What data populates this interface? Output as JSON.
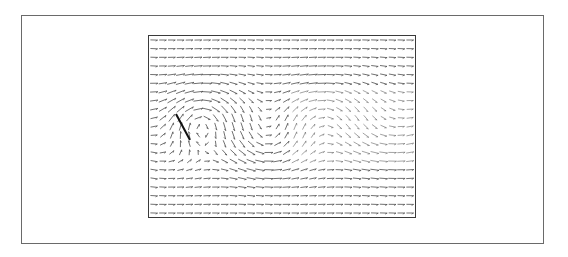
{
  "figure": {
    "title": "",
    "caption": ""
  },
  "chart_data": {
    "type": "quiver",
    "title": "",
    "xlabel": "",
    "ylabel": "",
    "grid": false,
    "legend": null,
    "grid_size": {
      "cols": 30,
      "rows": 21
    },
    "plot_bounds_px": {
      "x": 148,
      "y": 35,
      "width": 268,
      "height": 183
    },
    "background_flow": {
      "u": 1.0,
      "v": 0.0
    },
    "vortices": [
      {
        "cx": 0.17,
        "cy": 0.45,
        "strength": 1.0,
        "radius": 0.13,
        "sense": "clockwise"
      },
      {
        "cx": 0.42,
        "cy": 0.58,
        "strength": -0.55,
        "radius": 0.14,
        "sense": "counter-clockwise"
      },
      {
        "cx": 0.62,
        "cy": 0.42,
        "strength": 0.45,
        "radius": 0.15,
        "sense": "clockwise"
      },
      {
        "cx": 0.85,
        "cy": 0.56,
        "strength": -0.35,
        "radius": 0.15,
        "sense": "counter-clockwise"
      }
    ],
    "reference_vector": {
      "x1": 176,
      "y1": 114,
      "x2": 190,
      "y2": 140,
      "stroke_width": 2
    }
  },
  "colors": {
    "frame": "#6a6a6a",
    "plot_border": "#3a3a3a",
    "vector": "#444444",
    "reference_vector": "#111111"
  }
}
